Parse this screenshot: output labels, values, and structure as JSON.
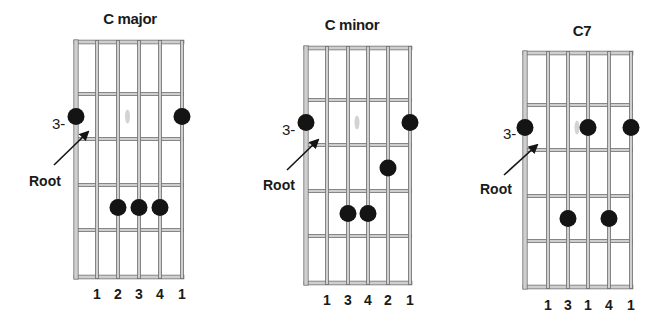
{
  "figure": {
    "colors": {
      "background": "#ffffff",
      "line_edge": "#6e6e6e",
      "line_fill": "#cfcfcf",
      "dot": "#141414",
      "text": "#1a1a1a",
      "smudge": "#c8c8c8"
    },
    "diagrams": [
      {
        "title": "C major",
        "fret_label": "3-",
        "root_label": "Root",
        "fingers": [
          "1",
          "2",
          "3",
          "4",
          "1"
        ],
        "strings_label_order": "left-to-right",
        "dots": [
          {
            "string": 1,
            "fret_row": 2
          },
          {
            "string": 6,
            "fret_row": 2
          },
          {
            "string": 3,
            "fret_row": 4
          },
          {
            "string": 4,
            "fret_row": 4
          },
          {
            "string": 5,
            "fret_row": 4
          }
        ]
      },
      {
        "title": "C minor",
        "fret_label": "3-",
        "root_label": "Root",
        "fingers": [
          "1",
          "3",
          "4",
          "2",
          "1"
        ],
        "dots": [
          {
            "string": 1,
            "fret_row": 2
          },
          {
            "string": 6,
            "fret_row": 2
          },
          {
            "string": 5,
            "fret_row": 3
          },
          {
            "string": 3,
            "fret_row": 4
          },
          {
            "string": 4,
            "fret_row": 4
          }
        ]
      },
      {
        "title": "C7",
        "fret_label": "3-",
        "root_label": "Root",
        "fingers": [
          "1",
          "3",
          "1",
          "4",
          "1"
        ],
        "dots": [
          {
            "string": 1,
            "fret_row": 2
          },
          {
            "string": 4,
            "fret_row": 2
          },
          {
            "string": 6,
            "fret_row": 2
          },
          {
            "string": 3,
            "fret_row": 4
          },
          {
            "string": 5,
            "fret_row": 4
          }
        ]
      }
    ]
  }
}
